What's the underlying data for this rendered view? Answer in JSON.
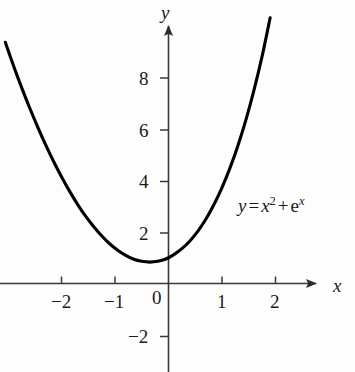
{
  "figure": {
    "background_color": "#fdfdfd",
    "curve_color": "#000000",
    "axis_color": "#3a3a3a"
  },
  "axes": {
    "x_axis_label": "x",
    "y_axis_label": "y",
    "x_axis_name": "x-axis",
    "y_axis_name": "y-axis",
    "origin_label": "0"
  },
  "ticks": {
    "x": [
      {
        "value": -2,
        "label": "−2"
      },
      {
        "value": -1,
        "label": "−1"
      },
      {
        "value": 0,
        "label": "0"
      },
      {
        "value": 1,
        "label": "1"
      },
      {
        "value": 2,
        "label": "2"
      }
    ],
    "y": [
      {
        "value": 8,
        "label": "8"
      },
      {
        "value": 6,
        "label": "6"
      },
      {
        "value": 4,
        "label": "4"
      },
      {
        "value": 2,
        "label": "2"
      },
      {
        "value": -2,
        "label": "−2"
      }
    ]
  },
  "equation": {
    "full_text": "y = x² + eˣ",
    "lhs": "y",
    "equals": "=",
    "term1_base": "x",
    "term1_exp": "2",
    "plus": "+",
    "term2_base": "e",
    "term2_exp": "x"
  },
  "chart_data": {
    "type": "line",
    "title": "",
    "xlabel": "x",
    "ylabel": "y",
    "function": "y = x^2 + e^x",
    "xlim": [
      -3.1,
      2.0
    ],
    "ylim": [
      -2.8,
      9.5
    ],
    "grid": false,
    "legend": "none",
    "annotations": [
      {
        "text": "y = x² + eˣ",
        "x": 1.35,
        "y": 3.2
      }
    ],
    "xticks": [
      -2,
      -1,
      0,
      1,
      2
    ],
    "yticks": [
      -2,
      2,
      4,
      6,
      8
    ],
    "series": [
      {
        "name": "y = x^2 + e^x",
        "x": [
          -3.05,
          -2.9,
          -2.75,
          -2.6,
          -2.45,
          -2.3,
          -2.15,
          -2.0,
          -1.85,
          -1.7,
          -1.55,
          -1.4,
          -1.25,
          -1.1,
          -0.95,
          -0.8,
          -0.65,
          -0.5,
          -0.35,
          -0.2,
          -0.05,
          0.1,
          0.25,
          0.4,
          0.55,
          0.7,
          0.85,
          1.0,
          1.15,
          1.3,
          1.45,
          1.6,
          1.75,
          1.9
        ],
        "y": [
          9.35,
          8.46,
          7.62,
          6.83,
          6.09,
          5.39,
          4.74,
          4.14,
          3.58,
          3.07,
          2.61,
          2.21,
          1.85,
          1.54,
          1.29,
          1.09,
          0.94,
          0.86,
          0.83,
          0.86,
          0.95,
          1.12,
          1.35,
          1.65,
          2.03,
          2.5,
          3.06,
          3.72,
          4.48,
          5.36,
          6.36,
          7.51,
          8.81,
          10.3
        ]
      }
    ]
  }
}
